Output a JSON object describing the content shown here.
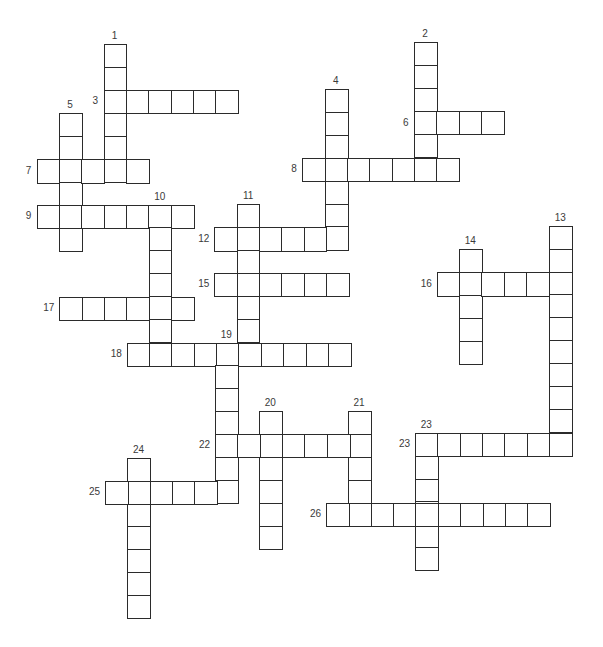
{
  "puzzle": {
    "title": "",
    "cell_width": 22.35,
    "cell_height": 22.9,
    "line_color": "#2b2b2b",
    "label_color": "#3a3a3a",
    "words": [
      {
        "number": "1",
        "direction": "down",
        "x": 103.6,
        "y": 44.3,
        "length": 6,
        "label_pos": "top"
      },
      {
        "number": "2",
        "direction": "down",
        "x": 414.0,
        "y": 42.3,
        "length": 6,
        "label_pos": "top"
      },
      {
        "number": "3",
        "direction": "across",
        "x": 103.6,
        "y": 89.5,
        "length": 6,
        "label_pos": "left"
      },
      {
        "number": "4",
        "direction": "down",
        "x": 324.8,
        "y": 89.0,
        "length": 7,
        "label_pos": "top"
      },
      {
        "number": "5",
        "direction": "down",
        "x": 59.0,
        "y": 113.3,
        "length": 6,
        "label_pos": "top"
      },
      {
        "number": "6",
        "direction": "across",
        "x": 414.0,
        "y": 111.0,
        "length": 4,
        "label_pos": "left"
      },
      {
        "number": "7",
        "direction": "across",
        "x": 36.7,
        "y": 159.3,
        "length": 5,
        "label_pos": "left"
      },
      {
        "number": "8",
        "direction": "across",
        "x": 302.3,
        "y": 157.7,
        "length": 7,
        "label_pos": "left"
      },
      {
        "number": "9",
        "direction": "across",
        "x": 36.7,
        "y": 204.5,
        "length": 7,
        "label_pos": "left"
      },
      {
        "number": "10",
        "direction": "down",
        "x": 148.5,
        "y": 204.5,
        "length": 7,
        "label_pos": "top"
      },
      {
        "number": "11",
        "direction": "down",
        "x": 236.7,
        "y": 204.3,
        "length": 7,
        "label_pos": "top"
      },
      {
        "number": "12",
        "direction": "across",
        "x": 214.3,
        "y": 227.3,
        "length": 6,
        "label_pos": "left"
      },
      {
        "number": "13",
        "direction": "down",
        "x": 549.0,
        "y": 225.7,
        "length": 10,
        "label_pos": "top"
      },
      {
        "number": "14",
        "direction": "down",
        "x": 459.0,
        "y": 249.3,
        "length": 5,
        "label_pos": "top"
      },
      {
        "number": "15",
        "direction": "across",
        "x": 214.3,
        "y": 273.0,
        "length": 6,
        "label_pos": "left"
      },
      {
        "number": "16",
        "direction": "across",
        "x": 436.7,
        "y": 272.3,
        "length": 6,
        "label_pos": "left"
      },
      {
        "number": "17",
        "direction": "across",
        "x": 59.3,
        "y": 297.0,
        "length": 6,
        "label_pos": "left"
      },
      {
        "number": "18",
        "direction": "across",
        "x": 126.7,
        "y": 342.5,
        "length": 10,
        "label_pos": "left"
      },
      {
        "number": "19",
        "direction": "down",
        "x": 215.0,
        "y": 342.5,
        "length": 7,
        "label_pos": "top"
      },
      {
        "number": "20",
        "direction": "down",
        "x": 259.0,
        "y": 411.0,
        "length": 6,
        "label_pos": "top"
      },
      {
        "number": "21",
        "direction": "down",
        "x": 347.8,
        "y": 411.0,
        "length": 5,
        "label_pos": "top"
      },
      {
        "number": "22",
        "direction": "across",
        "x": 215.0,
        "y": 434.0,
        "length": 7,
        "label_pos": "left"
      },
      {
        "number": "23",
        "direction": "across",
        "x": 415.0,
        "y": 432.7,
        "length": 7,
        "label_pos": "left"
      },
      {
        "number": "23",
        "direction": "down",
        "x": 415.0,
        "y": 432.7,
        "length": 6,
        "label_pos": "top"
      },
      {
        "number": "24",
        "direction": "down",
        "x": 127.3,
        "y": 457.7,
        "length": 7,
        "label_pos": "top"
      },
      {
        "number": "25",
        "direction": "across",
        "x": 105.0,
        "y": 481.0,
        "length": 6,
        "label_pos": "left"
      },
      {
        "number": "26",
        "direction": "across",
        "x": 326.0,
        "y": 502.7,
        "length": 10,
        "label_pos": "left"
      }
    ]
  }
}
